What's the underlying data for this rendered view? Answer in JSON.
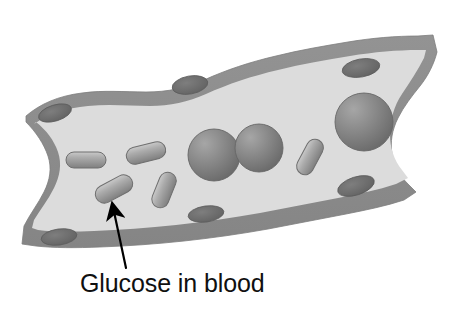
{
  "figure": {
    "type": "biology-diagram",
    "background_color": "#ffffff",
    "annotation": {
      "label": "Glucose in blood",
      "label_x": 80,
      "label_y": 292,
      "font_size": 25,
      "text_color": "#101010",
      "arrow": {
        "name": "glucose-pointer-arrow",
        "from_x": 126,
        "from_y": 268,
        "to_x": 113,
        "to_y": 207,
        "color": "#000000",
        "width": 2.2
      }
    },
    "vessel": {
      "name": "blood-vessel",
      "wall_color": "#8d8d8d",
      "wall_edge_color": "#7d7d7d",
      "lumen_color": "#dcdcdc",
      "outer_path": "M 26,116 C 40,104 58,96 82,93 C 104,90 124,92 146,92 C 168,92 186,88 204,80 C 226,70 250,62 276,56 C 300,50 324,46 348,42 C 372,38 396,36 418,36 L 433,35 L 437,52 C 434,64 428,76 420,86 C 412,96 404,106 398,118 C 392,130 390,142 392,154 C 394,166 400,176 408,184 L 416,192 L 404,200 C 386,206 366,210 346,214 C 320,219 294,224 268,229 C 240,234 212,238 184,241 C 156,244 128,246 100,247 C 76,248 54,248 36,246 L 22,244 L 24,226 C 30,214 38,204 44,192 C 50,180 52,168 48,156 C 44,144 36,132 26,122 Z",
      "lumen_path": "M 34,124 C 48,114 66,108 88,106 C 110,104 130,106 150,106 C 170,106 188,102 206,94 C 228,84 252,76 278,70 C 302,64 326,60 350,56 C 374,52 398,50 418,50 L 426,50 L 424,58 C 418,70 410,82 402,94 C 394,106 390,120 390,134 C 390,148 394,160 402,170 L 408,178 L 396,184 C 378,190 358,194 338,198 C 312,203 286,208 260,213 C 232,218 204,222 176,225 C 148,228 120,230 94,231 C 72,232 52,232 38,230 L 32,228 L 34,220 C 40,210 48,200 54,188 C 60,176 62,164 58,152 C 54,140 46,130 36,122 Z"
    },
    "endothelial_nuclei": [
      {
        "name": "nucleus-top-left",
        "cx": 55,
        "cy": 113,
        "rx": 17,
        "ry": 8,
        "rot": -17
      },
      {
        "name": "nucleus-top-mid",
        "cx": 190,
        "cy": 85,
        "rx": 18,
        "ry": 9,
        "rot": -10
      },
      {
        "name": "nucleus-top-right",
        "cx": 361,
        "cy": 68,
        "rx": 19,
        "ry": 9,
        "rot": -10
      },
      {
        "name": "nucleus-bottom-left",
        "cx": 59,
        "cy": 237,
        "rx": 18,
        "ry": 8,
        "rot": -8
      },
      {
        "name": "nucleus-bottom-mid",
        "cx": 206,
        "cy": 214,
        "rx": 18,
        "ry": 8,
        "rot": -8
      },
      {
        "name": "nucleus-bottom-right",
        "cx": 356,
        "cy": 186,
        "rx": 19,
        "ry": 9,
        "rot": -18
      }
    ],
    "nucleus_color": "#6e6e6e",
    "red_blood_cells": [
      {
        "name": "red-blood-cell-center-left",
        "cx": 214,
        "cy": 155,
        "r": 26
      },
      {
        "name": "red-blood-cell-center-right",
        "cx": 259,
        "cy": 148,
        "r": 24
      },
      {
        "name": "red-blood-cell-right",
        "cx": 364,
        "cy": 122,
        "r": 29
      }
    ],
    "rbc_color": "#7c7c7c",
    "rbc_highlight_color": "#a8a8a8",
    "glucose_molecules": [
      {
        "name": "glucose-capsule-1",
        "cx": 86,
        "cy": 160,
        "w": 40,
        "h": 16,
        "rot": 0
      },
      {
        "name": "glucose-capsule-2",
        "cx": 146,
        "cy": 153,
        "w": 40,
        "h": 17,
        "rot": -14
      },
      {
        "name": "glucose-capsule-3",
        "cx": 114,
        "cy": 189,
        "w": 40,
        "h": 18,
        "rot": -28
      },
      {
        "name": "glucose-capsule-4",
        "cx": 164,
        "cy": 190,
        "w": 37,
        "h": 17,
        "rot": -68
      },
      {
        "name": "glucose-capsule-5",
        "cx": 310,
        "cy": 157,
        "w": 38,
        "h": 17,
        "rot": -62
      }
    ],
    "glucose_color": "#9a9a9a",
    "glucose_highlight_color": "#c9c9c9",
    "glucose_edge_color": "#6f6f6f"
  }
}
